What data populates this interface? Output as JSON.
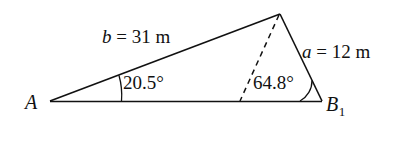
{
  "figure": {
    "type": "triangle-diagram",
    "background_color": "#ffffff",
    "stroke_color": "#111111",
    "vertices": {
      "A": {
        "label": "A",
        "x": 50,
        "y": 101
      },
      "B1": {
        "label": "B",
        "subscript": "1",
        "x": 322,
        "y": 101
      },
      "C": {
        "label": "",
        "x": 280,
        "y": 14
      }
    },
    "sides": [
      {
        "name": "b",
        "label_var": "b",
        "label_rest": " = 31 m",
        "value": 31,
        "unit": "m",
        "from": "A",
        "to": "C"
      },
      {
        "name": "a",
        "label_var": "a",
        "label_rest": " = 12 m",
        "value": 12,
        "unit": "m",
        "from": "C",
        "to": "B1"
      }
    ],
    "angles": [
      {
        "at": "A",
        "label": "20.5°",
        "value": 20.5,
        "unit": "degrees"
      },
      {
        "at": "B1",
        "label": "64.8°",
        "value": 64.8,
        "unit": "degrees"
      }
    ],
    "dashed_segment": {
      "from": "C",
      "to_x": 240,
      "to_y": 101,
      "style": "dashed"
    }
  }
}
